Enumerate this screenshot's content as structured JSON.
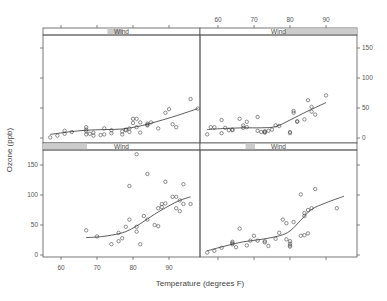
{
  "chart_data": {
    "type": "scatter",
    "title": "",
    "xlabel": "Temperature (degrees F)",
    "ylabel": "Ozone (ppb)",
    "xlim": [
      55,
      98
    ],
    "ylim": [
      -5,
      175
    ],
    "x_ticks": [
      60,
      70,
      80,
      90
    ],
    "y_ticks": [
      0,
      50,
      100,
      150
    ],
    "grid": false,
    "legend": "none",
    "strip_label": "Wind",
    "panel_layout": "2x2 conditioning panels (lattice xyplot with loess smooth), ordered bottom-left, bottom-right, top-left, top-right by increasing Wind",
    "panels": [
      {
        "position": "top-left",
        "strip": {
          "label": "Wind",
          "shade_start": 0.41,
          "shade_end": 0.51
        },
        "points": [
          [
            57,
            1
          ],
          [
            59,
            4
          ],
          [
            61,
            7
          ],
          [
            61,
            12
          ],
          [
            63,
            10
          ],
          [
            67,
            6
          ],
          [
            67,
            11
          ],
          [
            67,
            14
          ],
          [
            67,
            18
          ],
          [
            68,
            7
          ],
          [
            69,
            4
          ],
          [
            69,
            9
          ],
          [
            71,
            5
          ],
          [
            72,
            16
          ],
          [
            72,
            6
          ],
          [
            74,
            8
          ],
          [
            74,
            13
          ],
          [
            77,
            6
          ],
          [
            77,
            11
          ],
          [
            78,
            13
          ],
          [
            78,
            14
          ],
          [
            79,
            10
          ],
          [
            79,
            16
          ],
          [
            80,
            25
          ],
          [
            80,
            32
          ],
          [
            81,
            32
          ],
          [
            81,
            18
          ],
          [
            82,
            9
          ],
          [
            82,
            26
          ],
          [
            84,
            24
          ],
          [
            84,
            21
          ],
          [
            84,
            22
          ],
          [
            85,
            26
          ],
          [
            87,
            16
          ],
          [
            89,
            42
          ],
          [
            90,
            48
          ],
          [
            91,
            23
          ],
          [
            92,
            18
          ],
          [
            96,
            65
          ],
          [
            98,
            49
          ]
        ],
        "smooth": [
          [
            57,
            6
          ],
          [
            62,
            10
          ],
          [
            67,
            13
          ],
          [
            72,
            14
          ],
          [
            77,
            15
          ],
          [
            82,
            20
          ],
          [
            87,
            28
          ],
          [
            92,
            37
          ],
          [
            98,
            49
          ]
        ]
      },
      {
        "position": "top-right",
        "strip": {
          "label": "Wind",
          "shade_start": 0.54,
          "shade_end": 1.0
        },
        "points": [
          [
            57,
            6
          ],
          [
            58,
            18
          ],
          [
            59,
            18
          ],
          [
            61,
            30
          ],
          [
            61,
            8
          ],
          [
            62,
            17
          ],
          [
            63,
            13
          ],
          [
            64,
            13
          ],
          [
            64,
            14
          ],
          [
            66,
            32
          ],
          [
            67,
            21
          ],
          [
            67,
            17
          ],
          [
            68,
            27
          ],
          [
            68,
            18
          ],
          [
            71,
            35
          ],
          [
            71,
            12
          ],
          [
            72,
            10
          ],
          [
            73,
            11
          ],
          [
            73,
            9
          ],
          [
            73,
            10
          ],
          [
            74,
            12
          ],
          [
            75,
            14
          ],
          [
            76,
            21
          ],
          [
            77,
            20
          ],
          [
            80,
            8
          ],
          [
            80,
            10
          ],
          [
            81,
            42
          ],
          [
            81,
            45
          ],
          [
            82,
            27
          ],
          [
            82,
            28
          ],
          [
            84,
            31
          ],
          [
            85,
            63
          ],
          [
            86,
            44
          ],
          [
            86,
            52
          ],
          [
            87,
            39
          ],
          [
            90,
            71
          ]
        ],
        "smooth": [
          [
            57,
            14
          ],
          [
            62,
            16
          ],
          [
            67,
            17
          ],
          [
            72,
            17
          ],
          [
            76,
            19
          ],
          [
            80,
            30
          ],
          [
            85,
            45
          ],
          [
            90,
            59
          ]
        ]
      },
      {
        "position": "bottom-left",
        "strip": {
          "label": "Wind",
          "shade_start": 0.0,
          "shade_end": 0.28
        },
        "points": [
          [
            67,
            41
          ],
          [
            70,
            31
          ],
          [
            74,
            18
          ],
          [
            76,
            23
          ],
          [
            76,
            37
          ],
          [
            77,
            28
          ],
          [
            78,
            47
          ],
          [
            79,
            59
          ],
          [
            79,
            115
          ],
          [
            81,
            39
          ],
          [
            81,
            47
          ],
          [
            81,
            168
          ],
          [
            82,
            18
          ],
          [
            83,
            65
          ],
          [
            84,
            59
          ],
          [
            84,
            135
          ],
          [
            86,
            50
          ],
          [
            87,
            48
          ],
          [
            87,
            78
          ],
          [
            88,
            80
          ],
          [
            88,
            85
          ],
          [
            89,
            86
          ],
          [
            89,
            122
          ],
          [
            91,
            97
          ],
          [
            92,
            97
          ],
          [
            92,
            78
          ],
          [
            93,
            73
          ],
          [
            93,
            91
          ],
          [
            94,
            85
          ],
          [
            94,
            118
          ],
          [
            96,
            85
          ]
        ],
        "smooth": [
          [
            67,
            29
          ],
          [
            70,
            30
          ],
          [
            74,
            33
          ],
          [
            78,
            39
          ],
          [
            82,
            52
          ],
          [
            86,
            68
          ],
          [
            90,
            82
          ],
          [
            93,
            91
          ],
          [
            96,
            97
          ]
        ]
      },
      {
        "position": "bottom-right",
        "strip": {
          "label": "Wind",
          "shade_start": 0.29,
          "shade_end": 0.35
        },
        "points": [
          [
            57,
            4
          ],
          [
            59,
            7
          ],
          [
            61,
            12
          ],
          [
            64,
            18
          ],
          [
            64,
            20
          ],
          [
            64,
            22
          ],
          [
            65,
            13
          ],
          [
            66,
            44
          ],
          [
            68,
            16
          ],
          [
            69,
            24
          ],
          [
            70,
            32
          ],
          [
            71,
            24
          ],
          [
            73,
            21
          ],
          [
            73,
            23
          ],
          [
            74,
            15
          ],
          [
            76,
            27
          ],
          [
            77,
            37
          ],
          [
            78,
            59
          ],
          [
            79,
            53
          ],
          [
            79,
            26
          ],
          [
            80,
            23
          ],
          [
            80,
            19
          ],
          [
            80,
            16
          ],
          [
            80,
            14
          ],
          [
            81,
            55
          ],
          [
            83,
            101
          ],
          [
            83,
            32
          ],
          [
            84,
            33
          ],
          [
            85,
            36
          ],
          [
            84,
            65
          ],
          [
            84,
            70
          ],
          [
            85,
            75
          ],
          [
            86,
            78
          ],
          [
            87,
            110
          ],
          [
            93,
            78
          ]
        ],
        "smooth": [
          [
            57,
            7
          ],
          [
            62,
            15
          ],
          [
            67,
            22
          ],
          [
            72,
            26
          ],
          [
            77,
            32
          ],
          [
            80,
            40
          ],
          [
            83,
            58
          ],
          [
            86,
            76
          ],
          [
            90,
            87
          ],
          [
            95,
            98
          ]
        ]
      }
    ]
  },
  "axes": {
    "x_title": "Temperature (degrees F)",
    "y_title": "Ozone (ppb)",
    "x_tick_labels": [
      "60",
      "70",
      "80",
      "90"
    ],
    "y_tick_labels": [
      "0",
      "50",
      "100",
      "150"
    ]
  },
  "colors": {
    "frame": "#555555",
    "points": "#444444",
    "smooth_line": "#333333",
    "strip_bg": "#ffffff",
    "strip_shade": "#cccccc",
    "text": "#444444"
  }
}
